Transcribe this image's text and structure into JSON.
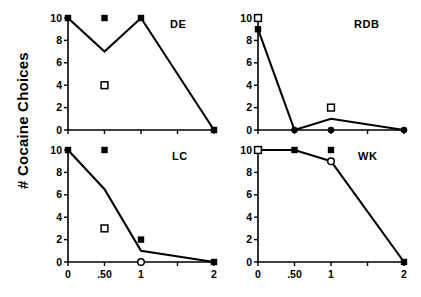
{
  "figure": {
    "ylabel": "# Cocaine Choices"
  },
  "axes": {
    "ytick_labels": [
      "0",
      "2",
      "4",
      "6",
      "8",
      "10"
    ],
    "ytick_values": [
      0,
      2,
      4,
      6,
      8,
      10
    ],
    "xtick_labels": [
      "0",
      ".50",
      "1",
      "",
      "2"
    ],
    "xtick_positions": [
      0,
      1,
      2,
      3,
      4
    ]
  },
  "chart_data": {
    "type": "line",
    "title": "",
    "xlabel": "",
    "ylabel": "# Cocaine Choices",
    "ylim": [
      0,
      10
    ],
    "grid": false,
    "legend": "none",
    "x": [
      "0",
      ".50",
      "1",
      "2"
    ],
    "panels": [
      {
        "label": "DE",
        "line": {
          "name": "cocaine choices",
          "x": [
            "0",
            ".50",
            "1",
            "2"
          ],
          "values": [
            10,
            7,
            10,
            0
          ]
        },
        "markers": [
          {
            "symbol": "filled-square",
            "x": "0",
            "y": 10
          },
          {
            "symbol": "filled-square",
            "x": ".50",
            "y": 10
          },
          {
            "symbol": "open-square",
            "x": ".50",
            "y": 4
          },
          {
            "symbol": "filled-square",
            "x": "1",
            "y": 10
          },
          {
            "symbol": "filled-square",
            "x": "2",
            "y": 0
          }
        ]
      },
      {
        "label": "RDB",
        "line": {
          "name": "cocaine choices",
          "x": [
            "0",
            ".50",
            "1",
            "2"
          ],
          "values": [
            9,
            0,
            1,
            0
          ]
        },
        "markers": [
          {
            "symbol": "open-square",
            "x": "0",
            "y": 10
          },
          {
            "symbol": "filled-square",
            "x": "0",
            "y": 9
          },
          {
            "symbol": "filled-circle",
            "x": ".50",
            "y": 0
          },
          {
            "symbol": "open-square",
            "x": "1",
            "y": 2
          },
          {
            "symbol": "filled-circle",
            "x": "1",
            "y": 0
          },
          {
            "symbol": "filled-circle",
            "x": "2",
            "y": 0
          }
        ]
      },
      {
        "label": "LC",
        "line": {
          "name": "cocaine choices",
          "x": [
            "0",
            ".50",
            "1",
            "2"
          ],
          "values": [
            10,
            6.5,
            1,
            0
          ]
        },
        "markers": [
          {
            "symbol": "filled-square",
            "x": "0",
            "y": 10
          },
          {
            "symbol": "filled-square",
            "x": ".50",
            "y": 10
          },
          {
            "symbol": "open-square",
            "x": ".50",
            "y": 3
          },
          {
            "symbol": "filled-square",
            "x": "1",
            "y": 2
          },
          {
            "symbol": "open-circle",
            "x": "1",
            "y": 0
          },
          {
            "symbol": "filled-square",
            "x": "2",
            "y": 0
          }
        ]
      },
      {
        "label": "WK",
        "line": {
          "name": "cocaine choices",
          "x": [
            "0",
            ".50",
            "1",
            "2"
          ],
          "values": [
            10,
            10,
            9,
            0
          ]
        },
        "markers": [
          {
            "symbol": "open-square",
            "x": "0",
            "y": 10
          },
          {
            "symbol": "filled-square",
            "x": ".50",
            "y": 10
          },
          {
            "symbol": "filled-square",
            "x": "1",
            "y": 10
          },
          {
            "symbol": "open-circle",
            "x": "1",
            "y": 9
          },
          {
            "symbol": "filled-square",
            "x": "2",
            "y": 0
          }
        ]
      }
    ]
  }
}
